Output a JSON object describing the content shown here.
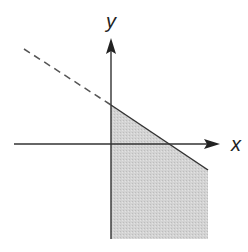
{
  "diagram": {
    "type": "linear-inequality-graph",
    "axes": {
      "x_label": "x",
      "y_label": "y",
      "origin_px": [
        111,
        144
      ],
      "x_axis_px": {
        "start": [
          14,
          144
        ],
        "end": [
          218,
          144
        ]
      },
      "y_axis_px": {
        "start": [
          111,
          239
        ],
        "end": [
          111,
          40
        ]
      }
    },
    "boundary_line": {
      "style_solid": "solid",
      "style_dashed": "dashed",
      "dashed_segment_px": {
        "start": [
          24,
          49
        ],
        "end": [
          111,
          105
        ]
      },
      "solid_segment_px": {
        "start": [
          111,
          105
        ],
        "end": [
          208,
          170
        ]
      },
      "y_intercept_px": [
        111,
        105
      ],
      "x_intercept_px": [
        170,
        144
      ],
      "slope_sign": "negative"
    },
    "shaded_region": {
      "description": "Region below the line with x >= 0",
      "vertices_px": [
        [
          111,
          105
        ],
        [
          208,
          170
        ],
        [
          208,
          239
        ],
        [
          111,
          239
        ]
      ],
      "fill_color": "#d0d0d0"
    },
    "colors": {
      "axis": "#333333",
      "line": "#333333",
      "dashed": "#555555",
      "shade": "#d0d0d0",
      "background": "#ffffff"
    }
  }
}
